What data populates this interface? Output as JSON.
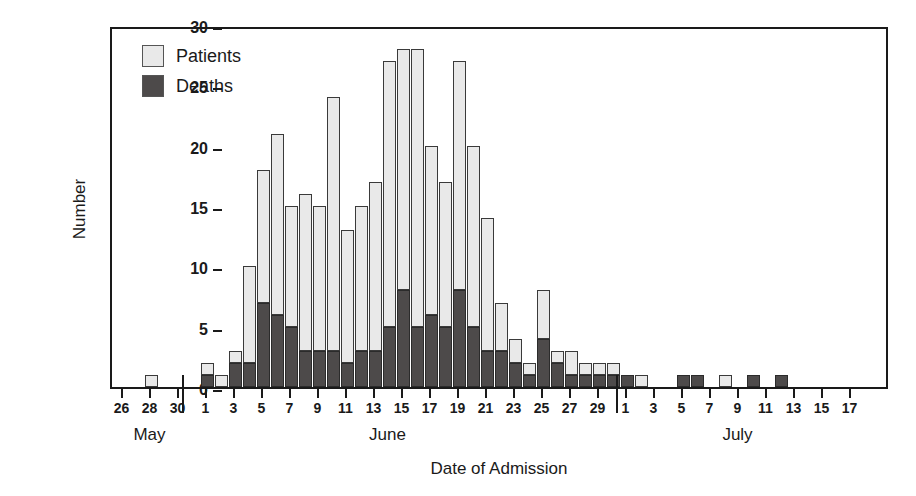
{
  "chart_data": {
    "type": "bar",
    "subtype": "stacked-epidemic-curve",
    "title": "",
    "xlabel": "Date of Admission",
    "ylabel": "Number",
    "ylim": [
      0,
      30
    ],
    "ytick_values": [
      0,
      5,
      10,
      15,
      20,
      25,
      30
    ],
    "ytick_labels": [
      "0",
      "5",
      "10",
      "15",
      "20",
      "25",
      "30"
    ],
    "grid": false,
    "legend_position": "top-left",
    "colors": {
      "patients": "#e9e9e9",
      "deaths": "#4d4a4a",
      "axis": "#1a1a1a"
    },
    "legend": [
      {
        "name": "Patients",
        "color": "#e9e9e9"
      },
      {
        "name": "Deaths",
        "color": "#4d4a4a"
      }
    ],
    "series": [
      {
        "name": "Patients",
        "stack_order": "top"
      },
      {
        "name": "Deaths",
        "stack_order": "bottom"
      }
    ],
    "month_groups": [
      {
        "label": "May",
        "center_day_index": 2
      },
      {
        "label": "June",
        "center_day_index": 19
      },
      {
        "label": "July",
        "center_day_index": 44
      }
    ],
    "month_separators_before_index": [
      5,
      36
    ],
    "xtick_labeled_indices": [
      0,
      2,
      4,
      5,
      7,
      9,
      11,
      13,
      15,
      17,
      19,
      21,
      23,
      25,
      27,
      29,
      31,
      33,
      35,
      36,
      38,
      40,
      42,
      44,
      46,
      48,
      50,
      52
    ],
    "categories": [
      "May 26",
      "May 27",
      "May 28",
      "May 29",
      "May 30",
      "May 31",
      "Jun 1",
      "Jun 2",
      "Jun 3",
      "Jun 4",
      "Jun 5",
      "Jun 6",
      "Jun 7",
      "Jun 8",
      "Jun 9",
      "Jun 10",
      "Jun 11",
      "Jun 12",
      "Jun 13",
      "Jun 14",
      "Jun 15",
      "Jun 16",
      "Jun 17",
      "Jun 18",
      "Jun 19",
      "Jun 20",
      "Jun 21",
      "Jun 22",
      "Jun 23",
      "Jun 24",
      "Jun 25",
      "Jun 26",
      "Jun 27",
      "Jun 28",
      "Jun 29",
      "Jun 30",
      "Jul 1",
      "Jul 2",
      "Jul 3",
      "Jul 4",
      "Jul 5",
      "Jul 6",
      "Jul 7",
      "Jul 8",
      "Jul 9",
      "Jul 10",
      "Jul 11",
      "Jul 12",
      "Jul 13",
      "Jul 14",
      "Jul 15",
      "Jul 16",
      "Jul 17"
    ],
    "tick_labels": [
      "26",
      "",
      "28",
      "",
      "30",
      "",
      "1",
      "",
      "3",
      "",
      "5",
      "",
      "7",
      "",
      "9",
      "",
      "11",
      "",
      "13",
      "",
      "15",
      "",
      "17",
      "",
      "19",
      "",
      "21",
      "",
      "23",
      "",
      "25",
      "",
      "27",
      "",
      "29",
      "",
      "1",
      "",
      "3",
      "",
      "5",
      "",
      "7",
      "",
      "9",
      "",
      "11",
      "",
      "13",
      "",
      "15",
      "",
      "17"
    ],
    "totals": [
      0,
      0,
      1,
      0,
      0,
      0,
      2,
      1,
      3,
      10,
      18,
      21,
      15,
      16,
      15,
      24,
      13,
      15,
      17,
      27,
      28,
      28,
      20,
      17,
      27,
      20,
      14,
      7,
      4,
      2,
      8,
      3,
      3,
      2,
      2,
      2,
      1,
      1,
      0,
      0,
      1,
      1,
      0,
      1,
      0,
      1,
      0,
      1,
      0,
      0,
      0,
      0,
      0
    ],
    "deaths": [
      0,
      0,
      0,
      0,
      0,
      0,
      1,
      0,
      2,
      2,
      7,
      6,
      5,
      3,
      3,
      3,
      2,
      3,
      3,
      5,
      8,
      5,
      6,
      5,
      8,
      5,
      3,
      3,
      2,
      1,
      4,
      2,
      1,
      1,
      1,
      1,
      1,
      0,
      0,
      0,
      1,
      1,
      0,
      0,
      0,
      1,
      0,
      1,
      0,
      0,
      0,
      0,
      0
    ],
    "patients_only": [
      0,
      0,
      1,
      0,
      0,
      0,
      1,
      1,
      1,
      8,
      11,
      15,
      10,
      13,
      12,
      21,
      11,
      12,
      14,
      22,
      20,
      23,
      14,
      12,
      19,
      15,
      11,
      4,
      2,
      1,
      4,
      1,
      2,
      1,
      1,
      1,
      0,
      1,
      0,
      0,
      0,
      0,
      0,
      1,
      0,
      0,
      0,
      0,
      0,
      0,
      0,
      0,
      0
    ]
  }
}
